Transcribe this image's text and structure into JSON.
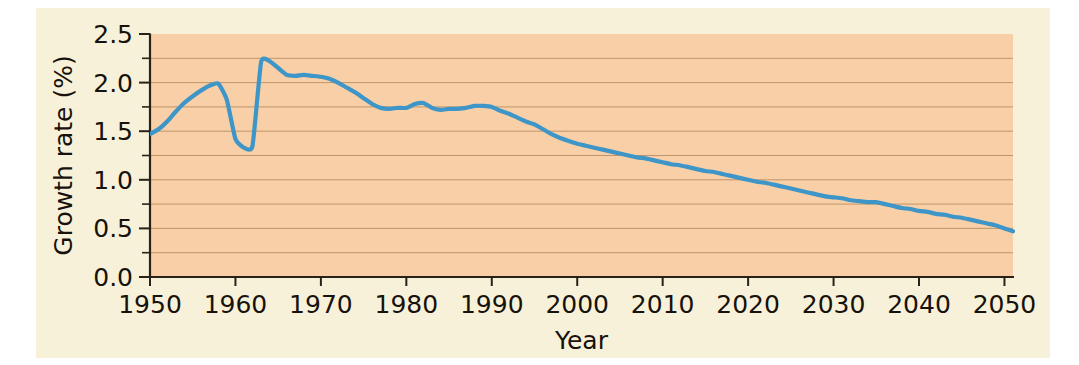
{
  "figure": {
    "background_color": "#f8f1d9",
    "plot_background_color": "#f8cfa6",
    "line_color": "#3d95c8",
    "grid_color": "#b08558",
    "axis_color": "#2a2118"
  },
  "chart_data": {
    "type": "line",
    "title": "",
    "subtitle": "",
    "xlabel": "Year",
    "ylabel": "Growth rate (%)",
    "xlim": [
      1950,
      2051
    ],
    "ylim": [
      0.0,
      2.5
    ],
    "xticks": [
      1950,
      1960,
      1970,
      1980,
      1990,
      2000,
      2010,
      2020,
      2030,
      2040,
      2050
    ],
    "xtick_labels": [
      "1950",
      "1960",
      "1970",
      "1980",
      "1990",
      "2000",
      "2010",
      "2020",
      "2030",
      "2040",
      "2050"
    ],
    "yticks": [
      0.0,
      0.5,
      1.0,
      1.5,
      2.0,
      2.5
    ],
    "ytick_labels": [
      "0.0",
      "0.5",
      "1.0",
      "1.5",
      "2.0",
      "2.5"
    ],
    "y_minor_ticks": [
      0.25,
      0.75,
      1.25,
      1.75,
      2.25
    ],
    "grid": "horizontal-minor-and-major",
    "grid_values": [
      0.25,
      0.5,
      0.75,
      1.0,
      1.25,
      1.5,
      1.75,
      2.0,
      2.25
    ],
    "legend": null,
    "annotations": [],
    "series": [
      {
        "name": "World population growth rate",
        "color": "#3d95c8",
        "x": [
          1950,
          1951,
          1952,
          1953,
          1954,
          1955,
          1956,
          1957,
          1958,
          1959,
          1960,
          1961,
          1962,
          1963,
          1964,
          1965,
          1966,
          1967,
          1968,
          1969,
          1970,
          1971,
          1972,
          1973,
          1974,
          1975,
          1976,
          1977,
          1978,
          1979,
          1980,
          1981,
          1982,
          1983,
          1984,
          1985,
          1986,
          1987,
          1988,
          1989,
          1990,
          1991,
          1992,
          1993,
          1994,
          1995,
          1996,
          1997,
          1998,
          1999,
          2000,
          2001,
          2002,
          2003,
          2004,
          2005,
          2006,
          2007,
          2008,
          2009,
          2010,
          2011,
          2012,
          2013,
          2014,
          2015,
          2016,
          2017,
          2018,
          2019,
          2020,
          2021,
          2022,
          2023,
          2024,
          2025,
          2026,
          2027,
          2028,
          2029,
          2030,
          2031,
          2032,
          2033,
          2034,
          2035,
          2036,
          2037,
          2038,
          2039,
          2040,
          2041,
          2042,
          2043,
          2044,
          2045,
          2046,
          2047,
          2048,
          2049,
          2050,
          2051
        ],
        "y": [
          1.47,
          1.52,
          1.6,
          1.7,
          1.79,
          1.86,
          1.92,
          1.97,
          1.99,
          1.82,
          1.42,
          1.33,
          1.35,
          2.21,
          2.22,
          2.15,
          2.08,
          2.07,
          2.08,
          2.07,
          2.06,
          2.04,
          2.0,
          1.95,
          1.9,
          1.84,
          1.78,
          1.74,
          1.73,
          1.74,
          1.74,
          1.78,
          1.79,
          1.74,
          1.72,
          1.73,
          1.73,
          1.74,
          1.76,
          1.76,
          1.75,
          1.71,
          1.68,
          1.64,
          1.6,
          1.57,
          1.52,
          1.47,
          1.43,
          1.4,
          1.37,
          1.35,
          1.33,
          1.31,
          1.29,
          1.27,
          1.25,
          1.23,
          1.22,
          1.2,
          1.18,
          1.16,
          1.15,
          1.13,
          1.11,
          1.09,
          1.08,
          1.06,
          1.04,
          1.02,
          1.0,
          0.98,
          0.97,
          0.95,
          0.93,
          0.91,
          0.89,
          0.87,
          0.85,
          0.83,
          0.82,
          0.81,
          0.79,
          0.78,
          0.77,
          0.77,
          0.75,
          0.73,
          0.71,
          0.7,
          0.68,
          0.67,
          0.65,
          0.64,
          0.62,
          0.61,
          0.59,
          0.57,
          0.55,
          0.53,
          0.5,
          0.47
        ]
      }
    ]
  }
}
